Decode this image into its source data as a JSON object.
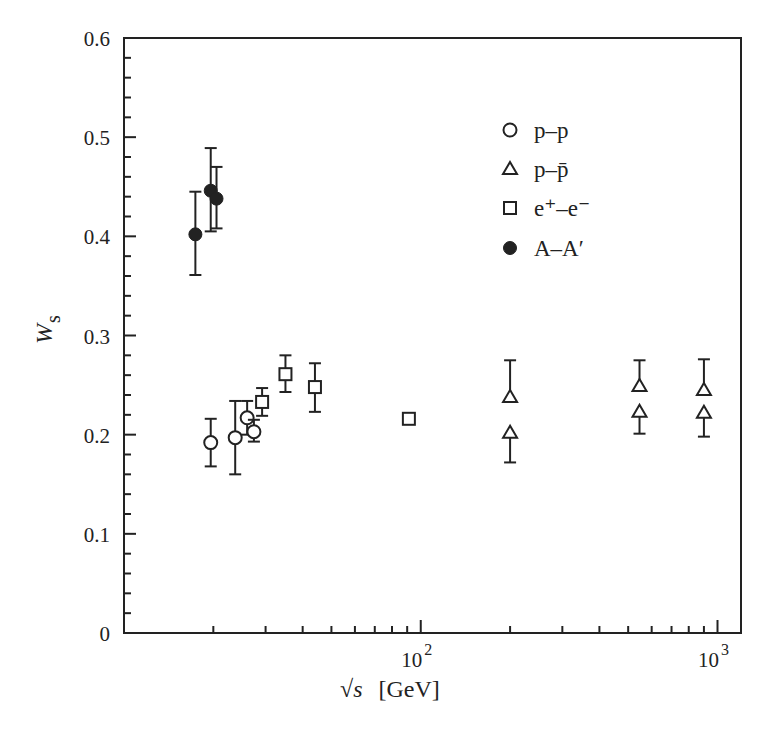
{
  "chart_data": {
    "type": "scatter",
    "title": "",
    "xlabel": "√s  [GeV]",
    "ylabel": "W_s",
    "xscale": "log",
    "xlim": [
      10,
      1200
    ],
    "ylim": [
      0,
      0.6
    ],
    "grid": false,
    "legend_position": "upper right (inside)",
    "y_ticks": [
      0,
      0.1,
      0.2,
      0.3,
      0.4,
      0.5,
      0.6
    ],
    "y_tick_labels": [
      "0",
      "0.1",
      "0.2",
      "0.3",
      "0.4",
      "0.5",
      "0.6"
    ],
    "y_minor_step": 0.02,
    "x_major_ticks": [
      100,
      1000
    ],
    "x_tick_labels": [
      {
        "base": "10",
        "exp": "2"
      },
      {
        "base": "10",
        "exp": "3"
      }
    ],
    "x_minor_ticks": [
      20,
      30,
      40,
      50,
      60,
      70,
      80,
      90,
      200,
      300,
      400,
      500,
      600,
      700,
      800,
      900
    ],
    "series": [
      {
        "name": "p–p",
        "marker": "open-circle",
        "points": [
          {
            "x": 19.6,
            "y": 0.192,
            "err_lo": 0.024,
            "err_hi": 0.024
          },
          {
            "x": 23.7,
            "y": 0.197,
            "err_lo": 0.037,
            "err_hi": 0.037
          },
          {
            "x": 26.0,
            "y": 0.217,
            "err_lo": 0.017,
            "err_hi": 0.017
          },
          {
            "x": 27.4,
            "y": 0.203,
            "err_lo": 0.01,
            "err_hi": 0.012
          }
        ]
      },
      {
        "name": "p–p̄",
        "marker": "open-triangle",
        "points": [
          {
            "x": 200,
            "y": 0.238,
            "err_lo": 0.0,
            "err_hi": 0.037
          },
          {
            "x": 200,
            "y": 0.202,
            "err_lo": 0.03,
            "err_hi": 0.0
          },
          {
            "x": 546,
            "y": 0.249,
            "err_lo": 0.0,
            "err_hi": 0.026
          },
          {
            "x": 546,
            "y": 0.223,
            "err_lo": 0.022,
            "err_hi": 0.0
          },
          {
            "x": 900,
            "y": 0.245,
            "err_lo": 0.0,
            "err_hi": 0.031
          },
          {
            "x": 900,
            "y": 0.222,
            "err_lo": 0.024,
            "err_hi": 0.0
          }
        ]
      },
      {
        "name": "e⁺–e⁻",
        "marker": "open-square",
        "points": [
          {
            "x": 29.2,
            "y": 0.233,
            "err_lo": 0.014,
            "err_hi": 0.014
          },
          {
            "x": 35.0,
            "y": 0.261,
            "err_lo": 0.018,
            "err_hi": 0.019
          },
          {
            "x": 44.0,
            "y": 0.248,
            "err_lo": 0.025,
            "err_hi": 0.024
          },
          {
            "x": 91.2,
            "y": 0.216,
            "err_lo": 0.0,
            "err_hi": 0.0
          }
        ]
      },
      {
        "name": "A–A′",
        "marker": "filled-circle",
        "points": [
          {
            "x": 17.4,
            "y": 0.402,
            "err_lo": 0.041,
            "err_hi": 0.043
          },
          {
            "x": 19.6,
            "y": 0.446,
            "err_lo": 0.041,
            "err_hi": 0.043
          },
          {
            "x": 20.5,
            "y": 0.438,
            "err_lo": 0.03,
            "err_hi": 0.032
          }
        ]
      }
    ]
  },
  "labels": {
    "y_axis_main": "W",
    "y_axis_sub": "s",
    "x_axis_sqrt": "√",
    "x_axis_var": "s",
    "x_axis_unit": "[GeV]"
  },
  "legend": [
    {
      "marker": "open-circle",
      "label": "p–p"
    },
    {
      "marker": "open-triangle",
      "label": "p–p̄"
    },
    {
      "marker": "open-square",
      "label": "e⁺–e⁻"
    },
    {
      "marker": "filled-circle",
      "label": "A–A′"
    }
  ],
  "colors": {
    "ink": "#222222",
    "background": "#ffffff"
  }
}
